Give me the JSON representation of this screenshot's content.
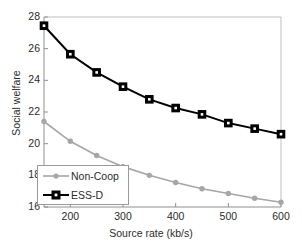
{
  "chart_data": {
    "type": "line",
    "title": "",
    "xlabel": "Source rate (kb/s)",
    "ylabel": "Social welfare",
    "xlim": [
      150,
      600
    ],
    "ylim": [
      16,
      28
    ],
    "xticks": [
      200,
      300,
      400,
      500,
      600
    ],
    "yticks": [
      16,
      18,
      20,
      22,
      24,
      26,
      28
    ],
    "grid": false,
    "legend_position": "lower-left",
    "x": [
      150,
      200,
      250,
      300,
      350,
      400,
      450,
      500,
      550,
      600
    ],
    "series": [
      {
        "name": "Non-Coop",
        "color": "#a6a6a6",
        "marker": "circle",
        "values": [
          21.4,
          20.15,
          19.25,
          18.55,
          18.0,
          17.55,
          17.15,
          16.85,
          16.55,
          16.3
        ]
      },
      {
        "name": "ESS-D",
        "color": "#000000",
        "marker": "square",
        "values": [
          27.45,
          25.65,
          24.5,
          23.6,
          22.8,
          22.25,
          21.85,
          21.3,
          20.95,
          20.6
        ]
      }
    ]
  },
  "axis": {
    "xtick_labels": [
      "200",
      "300",
      "400",
      "500",
      "600"
    ],
    "ytick_labels": [
      "16",
      "18",
      "20",
      "22",
      "24",
      "26",
      "28"
    ],
    "xlabel": "Source rate (kb/s)",
    "ylabel": "Social welfare"
  },
  "legend": {
    "items": [
      {
        "label": "Non-Coop"
      },
      {
        "label": "ESS-D"
      }
    ]
  }
}
